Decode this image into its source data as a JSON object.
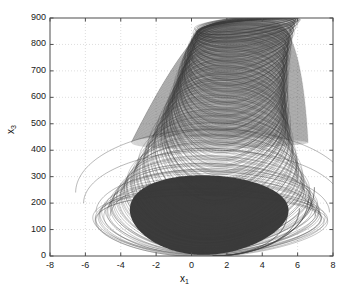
{
  "chart_data": {
    "type": "line",
    "title": "",
    "subtitle": "",
    "xlabel": "x_1",
    "ylabel": "x_3",
    "xlabel_base": "x",
    "xlabel_sub": "1",
    "ylabel_base": "x",
    "ylabel_sub": "3",
    "xlim": [
      -8,
      8
    ],
    "ylim": [
      0,
      900
    ],
    "xticks": [
      -8,
      -6,
      -4,
      -2,
      0,
      2,
      4,
      6,
      8
    ],
    "xtick_labels": [
      "-8",
      "-6",
      "-4",
      "-2",
      "0",
      "2",
      "4",
      "6",
      "8"
    ],
    "yticks": [
      0,
      100,
      200,
      300,
      400,
      500,
      600,
      700,
      800,
      900
    ],
    "ytick_labels": [
      "0",
      "100",
      "200",
      "300",
      "400",
      "500",
      "600",
      "700",
      "800",
      "900"
    ],
    "grid": true,
    "grid_style": "dotted",
    "grid_color": "#c8c8c8",
    "legend": null,
    "legend_position": "none",
    "line_color": "#3a3a3a",
    "axis_color": "#4d4d4d",
    "background": "#ffffff",
    "series": [
      {
        "name": "trajectory",
        "comment": "Nested loop envelope: each loop is an ellipse centered at (cx,cy) with semi-axes (rx,ry) and a vertical shear; values read from the plotted attractor",
        "loops": [
          {
            "cx": 1.05,
            "cy": 118,
            "rx": 6.55,
            "ry": 118,
            "shear": 0.0,
            "w": 0.55,
            "o": 0.55
          },
          {
            "cx": 1.1,
            "cy": 132,
            "rx": 6.3,
            "ry": 128,
            "shear": 0.02,
            "w": 0.55,
            "o": 0.52
          },
          {
            "cx": 1.15,
            "cy": 150,
            "rx": 6.05,
            "ry": 140,
            "shear": 0.04,
            "w": 0.55,
            "o": 0.52
          },
          {
            "cx": 1.2,
            "cy": 168,
            "rx": 5.8,
            "ry": 152,
            "shear": 0.06,
            "w": 0.55,
            "o": 0.5
          },
          {
            "cx": 1.25,
            "cy": 186,
            "rx": 5.58,
            "ry": 162,
            "shear": 0.08,
            "w": 0.55,
            "o": 0.5
          },
          {
            "cx": 1.3,
            "cy": 205,
            "rx": 5.36,
            "ry": 172,
            "shear": 0.1,
            "w": 0.55,
            "o": 0.48
          },
          {
            "cx": 1.35,
            "cy": 224,
            "rx": 5.16,
            "ry": 180,
            "shear": 0.12,
            "w": 0.55,
            "o": 0.48
          },
          {
            "cx": 1.4,
            "cy": 244,
            "rx": 4.96,
            "ry": 188,
            "shear": 0.14,
            "w": 0.55,
            "o": 0.46
          },
          {
            "cx": 1.45,
            "cy": 264,
            "rx": 4.78,
            "ry": 194,
            "shear": 0.16,
            "w": 0.55,
            "o": 0.46
          },
          {
            "cx": 1.5,
            "cy": 285,
            "rx": 4.6,
            "ry": 200,
            "shear": 0.18,
            "w": 0.55,
            "o": 0.45
          },
          {
            "cx": 1.55,
            "cy": 306,
            "rx": 4.44,
            "ry": 204,
            "shear": 0.2,
            "w": 0.55,
            "o": 0.45
          },
          {
            "cx": 1.6,
            "cy": 328,
            "rx": 4.28,
            "ry": 208,
            "shear": 0.22,
            "w": 0.55,
            "o": 0.44
          },
          {
            "cx": 1.65,
            "cy": 350,
            "rx": 4.14,
            "ry": 210,
            "shear": 0.24,
            "w": 0.55,
            "o": 0.44
          },
          {
            "cx": 1.7,
            "cy": 372,
            "rx": 4.0,
            "ry": 212,
            "shear": 0.26,
            "w": 0.55,
            "o": 0.43
          },
          {
            "cx": 1.75,
            "cy": 395,
            "rx": 3.88,
            "ry": 212,
            "shear": 0.28,
            "w": 0.55,
            "o": 0.43
          },
          {
            "cx": 1.8,
            "cy": 418,
            "rx": 3.76,
            "ry": 212,
            "shear": 0.3,
            "w": 0.55,
            "o": 0.42
          },
          {
            "cx": 1.85,
            "cy": 441,
            "rx": 3.66,
            "ry": 210,
            "shear": 0.32,
            "w": 0.55,
            "o": 0.42
          },
          {
            "cx": 1.9,
            "cy": 464,
            "rx": 3.56,
            "ry": 208,
            "shear": 0.34,
            "w": 0.55,
            "o": 0.41
          },
          {
            "cx": 1.95,
            "cy": 487,
            "rx": 3.48,
            "ry": 205,
            "shear": 0.36,
            "w": 0.55,
            "o": 0.41
          },
          {
            "cx": 2.0,
            "cy": 510,
            "rx": 3.4,
            "ry": 200,
            "shear": 0.38,
            "w": 0.55,
            "o": 0.4
          },
          {
            "cx": 2.05,
            "cy": 532,
            "rx": 3.33,
            "ry": 195,
            "shear": 0.4,
            "w": 0.55,
            "o": 0.4
          },
          {
            "cx": 2.1,
            "cy": 554,
            "rx": 3.27,
            "ry": 190,
            "shear": 0.42,
            "w": 0.55,
            "o": 0.4
          },
          {
            "cx": 2.15,
            "cy": 576,
            "rx": 3.21,
            "ry": 184,
            "shear": 0.44,
            "w": 0.55,
            "o": 0.4
          },
          {
            "cx": 2.2,
            "cy": 597,
            "rx": 3.16,
            "ry": 178,
            "shear": 0.46,
            "w": 0.55,
            "o": 0.4
          },
          {
            "cx": 2.25,
            "cy": 618,
            "rx": 3.11,
            "ry": 172,
            "shear": 0.48,
            "w": 0.55,
            "o": 0.4
          },
          {
            "cx": 2.3,
            "cy": 638,
            "rx": 3.07,
            "ry": 165,
            "shear": 0.5,
            "w": 0.55,
            "o": 0.4
          },
          {
            "cx": 2.35,
            "cy": 657,
            "rx": 3.03,
            "ry": 158,
            "shear": 0.52,
            "w": 0.55,
            "o": 0.4
          },
          {
            "cx": 2.4,
            "cy": 676,
            "rx": 3.0,
            "ry": 150,
            "shear": 0.54,
            "w": 0.55,
            "o": 0.4
          },
          {
            "cx": 2.45,
            "cy": 694,
            "rx": 2.97,
            "ry": 142,
            "shear": 0.56,
            "w": 0.55,
            "o": 0.4
          },
          {
            "cx": 2.5,
            "cy": 711,
            "rx": 2.94,
            "ry": 134,
            "shear": 0.58,
            "w": 0.55,
            "o": 0.4
          },
          {
            "cx": 2.55,
            "cy": 727,
            "rx": 2.92,
            "ry": 126,
            "shear": 0.6,
            "w": 0.55,
            "o": 0.4
          },
          {
            "cx": 2.6,
            "cy": 743,
            "rx": 2.9,
            "ry": 118,
            "shear": 0.62,
            "w": 0.55,
            "o": 0.4
          },
          {
            "cx": 2.65,
            "cy": 758,
            "rx": 2.88,
            "ry": 110,
            "shear": 0.64,
            "w": 0.55,
            "o": 0.4
          },
          {
            "cx": 2.7,
            "cy": 772,
            "rx": 2.87,
            "ry": 102,
            "shear": 0.66,
            "w": 0.55,
            "o": 0.4
          },
          {
            "cx": 2.75,
            "cy": 786,
            "rx": 2.86,
            "ry": 94,
            "shear": 0.68,
            "w": 0.55,
            "o": 0.4
          },
          {
            "cx": 2.8,
            "cy": 799,
            "rx": 2.85,
            "ry": 86,
            "shear": 0.7,
            "w": 0.55,
            "o": 0.4
          },
          {
            "cx": 2.85,
            "cy": 811,
            "rx": 2.84,
            "ry": 78,
            "shear": 0.72,
            "w": 0.55,
            "o": 0.4
          },
          {
            "cx": 2.9,
            "cy": 822,
            "rx": 2.84,
            "ry": 70,
            "shear": 0.74,
            "w": 0.55,
            "o": 0.4
          },
          {
            "cx": 2.95,
            "cy": 833,
            "rx": 2.84,
            "ry": 62,
            "shear": 0.76,
            "w": 0.55,
            "o": 0.4
          },
          {
            "cx": 3.0,
            "cy": 843,
            "rx": 2.84,
            "ry": 54,
            "shear": 0.78,
            "w": 0.55,
            "o": 0.4
          },
          {
            "cx": 3.05,
            "cy": 852,
            "rx": 2.85,
            "ry": 46,
            "shear": 0.8,
            "w": 0.55,
            "o": 0.4
          },
          {
            "cx": 3.1,
            "cy": 860,
            "rx": 2.86,
            "ry": 38,
            "shear": 0.82,
            "w": 0.55,
            "o": 0.4
          },
          {
            "cx": 3.15,
            "cy": 867,
            "rx": 2.88,
            "ry": 30,
            "shear": 0.84,
            "w": 0.55,
            "o": 0.4
          },
          {
            "cx": 3.2,
            "cy": 873,
            "rx": 2.9,
            "ry": 23,
            "shear": 0.86,
            "w": 0.55,
            "o": 0.4
          }
        ],
        "core": {
          "comment": "dense black core region of the attractor",
          "cx": 1.0,
          "cy": 155,
          "rx": 4.45,
          "ry": 150,
          "fill": "#2b2b2b"
        },
        "outer_envelope": {
          "comment": "outermost sweeping arcs reaching to x1=-7 and x1=7",
          "x_min": -6.6,
          "x_max": 7.1,
          "y_min": 0,
          "y_max": 880
        }
      }
    ]
  }
}
